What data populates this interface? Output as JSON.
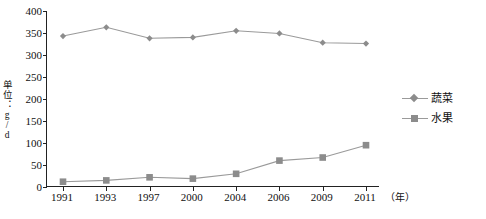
{
  "chart_data": {
    "type": "line",
    "title": "",
    "xlabel": "（年）",
    "ylabel": "单位：g/d",
    "categories": [
      "1991",
      "1993",
      "1997",
      "2000",
      "2004",
      "2006",
      "2009",
      "2011"
    ],
    "ylim": [
      0,
      400
    ],
    "ytick_labels": [
      "0",
      "50",
      "100",
      "150",
      "200",
      "250",
      "300",
      "350",
      "400"
    ],
    "ytick_values": [
      0,
      50,
      100,
      150,
      200,
      250,
      300,
      350,
      400
    ],
    "grid": false,
    "legend_position": "right",
    "series": [
      {
        "name": "蔬菜",
        "marker": "diamond",
        "color": "#8c8c8c",
        "values": [
          343,
          363,
          338,
          340,
          355,
          349,
          328,
          326
        ]
      },
      {
        "name": "水果",
        "marker": "square",
        "color": "#8c8c8c",
        "values": [
          12,
          15,
          22,
          19,
          30,
          60,
          67,
          95
        ]
      }
    ]
  },
  "axes": {
    "x_unit_label": "（年）",
    "y_axis_title": "单位：g/d"
  },
  "legend": {
    "items": [
      {
        "label": "蔬菜",
        "marker": "diamond-marker-icon"
      },
      {
        "label": "水果",
        "marker": "square-marker-icon"
      }
    ]
  },
  "colors": {
    "series": "#8c8c8c",
    "line": "#9a9a9a",
    "axis": "#222222",
    "text": "#111111",
    "background": "#ffffff"
  }
}
